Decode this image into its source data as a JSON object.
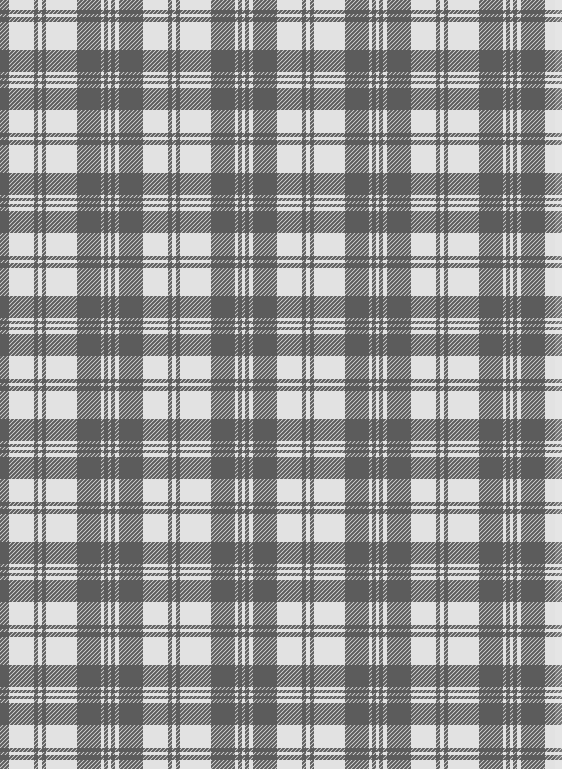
{
  "image": {
    "description": "Gray and white plaid (tartan) fabric texture with twill weave",
    "width": 562,
    "height": 769
  },
  "colors": {
    "light": "#e2e2e2",
    "dark": "#5c5c5c",
    "edge_tint": "#d6d6d6"
  },
  "twill": {
    "pitch": 4,
    "direction": "bottom-left-to-top-right"
  },
  "warp": {
    "orientation": "vertical",
    "period": 134,
    "offset": 77,
    "dark_bands": [
      [
        0,
        24
      ],
      [
        27,
        31
      ],
      [
        34,
        38
      ],
      [
        42,
        66
      ],
      [
        91,
        95
      ],
      [
        99,
        103
      ]
    ]
  },
  "weft": {
    "orientation": "horizontal",
    "period": 123,
    "offset": 50,
    "dark_bands": [
      [
        0,
        22
      ],
      [
        25,
        28
      ],
      [
        31,
        34
      ],
      [
        38,
        60
      ],
      [
        83,
        87
      ],
      [
        90,
        95
      ]
    ]
  }
}
